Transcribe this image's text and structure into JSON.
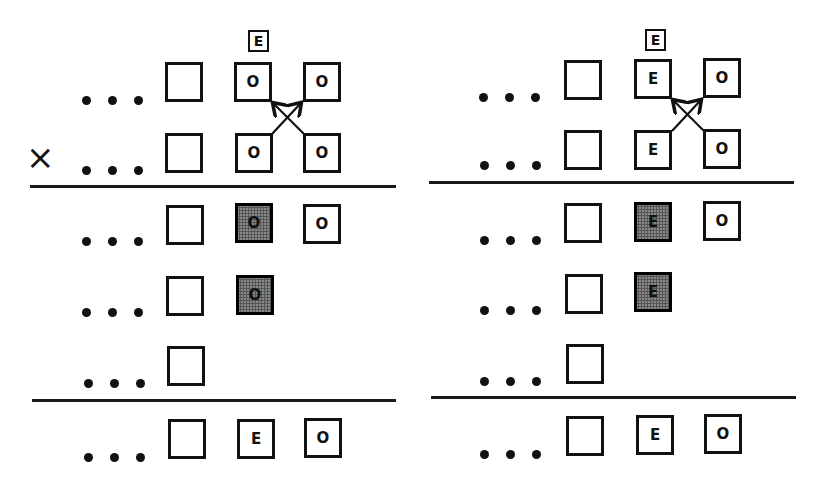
{
  "panels": [
    {
      "id": "left",
      "marker": "×",
      "incoming_label": "E",
      "rows_above": [
        {
          "cells": [
            "",
            "O",
            "O"
          ]
        },
        {
          "cells": [
            "",
            "O",
            "O"
          ]
        }
      ],
      "rows_middle": [
        {
          "cells": [
            "",
            "O",
            "O"
          ],
          "shaded": [
            false,
            true,
            false
          ]
        },
        {
          "cells": [
            "",
            "O"
          ],
          "shaded": [
            false,
            true
          ]
        },
        {
          "cells": [
            ""
          ],
          "shaded": [
            false
          ]
        }
      ],
      "rows_below": [
        {
          "cells": [
            "",
            "E",
            "O"
          ]
        }
      ],
      "ellipsis": "..."
    },
    {
      "id": "right",
      "marker": "",
      "incoming_label": "E",
      "rows_above": [
        {
          "cells": [
            "",
            "E",
            "O"
          ]
        },
        {
          "cells": [
            "",
            "E",
            "O"
          ]
        }
      ],
      "rows_middle": [
        {
          "cells": [
            "",
            "E",
            "O"
          ],
          "shaded": [
            false,
            true,
            false
          ]
        },
        {
          "cells": [
            "",
            "E"
          ],
          "shaded": [
            false,
            true
          ]
        },
        {
          "cells": [
            ""
          ],
          "shaded": [
            false
          ]
        }
      ],
      "rows_below": [
        {
          "cells": [
            "",
            "E",
            "O"
          ]
        }
      ],
      "ellipsis": "..."
    }
  ],
  "colors": {
    "ink": "#111111",
    "shade": "#8a8a8a",
    "background": "#ffffff"
  }
}
